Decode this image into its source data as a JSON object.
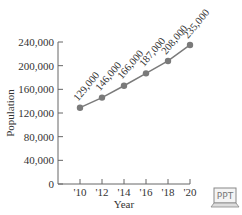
{
  "chart_data": {
    "type": "line",
    "title": "",
    "xlabel": "Year",
    "ylabel": "Population",
    "categories": [
      "'10",
      "'12",
      "'14",
      "'16",
      "'18",
      "'20"
    ],
    "x": [
      2010,
      2012,
      2014,
      2016,
      2018,
      2020
    ],
    "values": [
      129000,
      146000,
      166000,
      187000,
      208000,
      235000
    ],
    "data_labels": [
      "129,000",
      "146,000",
      "166,000",
      "187,000",
      "208,000",
      "235,000"
    ],
    "yticks": [
      "0",
      "40,000",
      "80,000",
      "120,000",
      "160,000",
      "200,000",
      "240,000"
    ],
    "ylim": [
      0,
      240000
    ],
    "grid": false,
    "legend": "none",
    "line_color": "#7a7a7a",
    "marker_color": "#7a7a7a"
  },
  "badge": {
    "label": "PPT"
  }
}
